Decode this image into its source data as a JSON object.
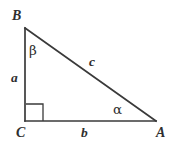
{
  "figure": {
    "type": "right-triangle-diagram",
    "background_color": "#ffffff",
    "stroke_color": "#3a3a3a",
    "text_color": "#2f2f2f",
    "stroke_width": 1.6,
    "canvas": {
      "width": 175,
      "height": 147
    },
    "vertices": [
      {
        "id": "B",
        "label": "B",
        "x": 25,
        "y": 28,
        "angle_name": "beta"
      },
      {
        "id": "C",
        "label": "C",
        "x": 25,
        "y": 121,
        "angle_name": "right-angle"
      },
      {
        "id": "A",
        "label": "A",
        "x": 156,
        "y": 121,
        "angle_name": "alpha"
      }
    ],
    "sides": [
      {
        "id": "a",
        "label": "a",
        "from": "B",
        "to": "C",
        "role": "vertical-leg"
      },
      {
        "id": "b",
        "label": "b",
        "from": "C",
        "to": "A",
        "role": "horizontal-leg"
      },
      {
        "id": "c",
        "label": "c",
        "from": "B",
        "to": "A",
        "role": "hypotenuse"
      }
    ],
    "angles": [
      {
        "id": "beta",
        "label": "β",
        "at_vertex": "B"
      },
      {
        "id": "alpha",
        "label": "α",
        "at_vertex": "A"
      },
      {
        "id": "right",
        "label": "",
        "at_vertex": "C",
        "marker": "square"
      }
    ],
    "right_angle_marker": {
      "x": 26,
      "y": 104,
      "width": 17,
      "height": 17
    }
  }
}
